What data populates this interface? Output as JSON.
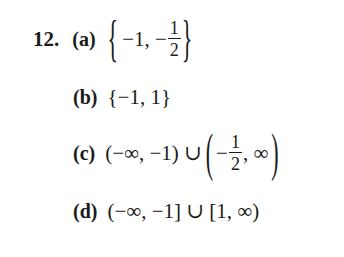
{
  "problem": {
    "number": "12.",
    "parts": [
      {
        "label": "(a)",
        "answer_text": "{−1, −1/2}",
        "open": "{",
        "first": "−1, −",
        "frac_num": "1",
        "frac_den": "2",
        "close": "}"
      },
      {
        "label": "(b)",
        "answer_text": "{−1, 1}"
      },
      {
        "label": "(c)",
        "answer_text": "(−∞, −1) ∪ (−1/2, ∞)",
        "left": "(−∞, −1) ∪",
        "open": "(",
        "minus": "−",
        "frac_num": "1",
        "frac_den": "2",
        "tail": ", ∞",
        "close": ")"
      },
      {
        "label": "(d)",
        "answer_text": "(−∞, −1] ∪ [1, ∞)"
      }
    ]
  }
}
